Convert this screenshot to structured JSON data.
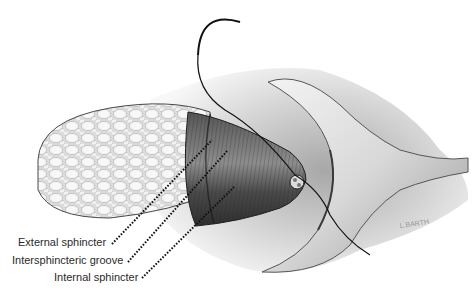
{
  "figure": {
    "labels": [
      {
        "id": "external",
        "text": "External sphincter"
      },
      {
        "id": "intersphincteric",
        "text": "Intersphincteric groove"
      },
      {
        "id": "internal",
        "text": "Internal sphincter"
      }
    ],
    "signature": "L.BARTH"
  },
  "colors": {
    "background": "#ffffff",
    "ink": "#1e1e1e",
    "fat": "#e9e9e9",
    "muscle_dark": "#3a3a3a",
    "skin": "#c8c8c8"
  }
}
